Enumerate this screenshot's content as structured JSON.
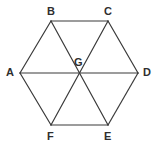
{
  "figure": {
    "shape_type": "regular-hexagon-with-diagonals",
    "background_color": "#ffffff",
    "stroke_color": "#3a3a3a",
    "stroke_width": 1.2,
    "label_color": "#2e2e2e",
    "label_font_size": 11,
    "canvas": {
      "width": 159,
      "height": 149
    },
    "vertices": [
      {
        "id": "A",
        "label": "A",
        "x": 20,
        "y": 73,
        "label_x": 6,
        "label_y": 67
      },
      {
        "id": "B",
        "label": "B",
        "x": 51,
        "y": 21,
        "label_x": 47,
        "label_y": 6
      },
      {
        "id": "C",
        "label": "C",
        "x": 108,
        "y": 21,
        "label_x": 104,
        "label_y": 6
      },
      {
        "id": "D",
        "label": "D",
        "x": 138,
        "y": 73,
        "label_x": 143,
        "label_y": 67
      },
      {
        "id": "E",
        "label": "E",
        "x": 108,
        "y": 125,
        "label_x": 104,
        "label_y": 131
      },
      {
        "id": "F",
        "label": "F",
        "x": 51,
        "y": 125,
        "label_x": 47,
        "label_y": 131
      },
      {
        "id": "G",
        "label": "G",
        "x": 79,
        "y": 73,
        "label_x": 74,
        "label_y": 57
      }
    ],
    "perimeter_edges": [
      {
        "name": "AB",
        "from": "A",
        "to": "B"
      },
      {
        "name": "BC",
        "from": "B",
        "to": "C"
      },
      {
        "name": "CD",
        "from": "C",
        "to": "D"
      },
      {
        "name": "DE",
        "from": "D",
        "to": "E"
      },
      {
        "name": "EF",
        "from": "E",
        "to": "F"
      },
      {
        "name": "FA",
        "from": "F",
        "to": "A"
      }
    ],
    "diagonals": [
      {
        "name": "AD",
        "from": "A",
        "to": "D"
      },
      {
        "name": "BE",
        "from": "B",
        "to": "E"
      },
      {
        "name": "CF",
        "from": "C",
        "to": "F"
      }
    ]
  }
}
